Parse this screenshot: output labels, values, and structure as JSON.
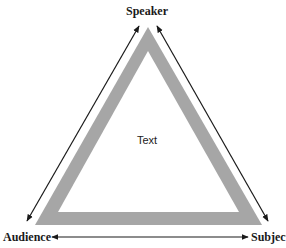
{
  "diagram": {
    "vertices": {
      "top": "Speaker",
      "bottom_left": "Audience",
      "bottom_right": "Subject"
    },
    "center_label": "Text",
    "edges": [
      {
        "from": "Speaker",
        "to": "Audience",
        "style": "double-arrow"
      },
      {
        "from": "Speaker",
        "to": "Subject",
        "style": "double-arrow"
      },
      {
        "from": "Audience",
        "to": "Subject",
        "style": "double-arrow"
      }
    ],
    "colors": {
      "triangle_band": "#a6a6a6",
      "arrow": "#1a1a1a",
      "background": "#ffffff"
    }
  }
}
